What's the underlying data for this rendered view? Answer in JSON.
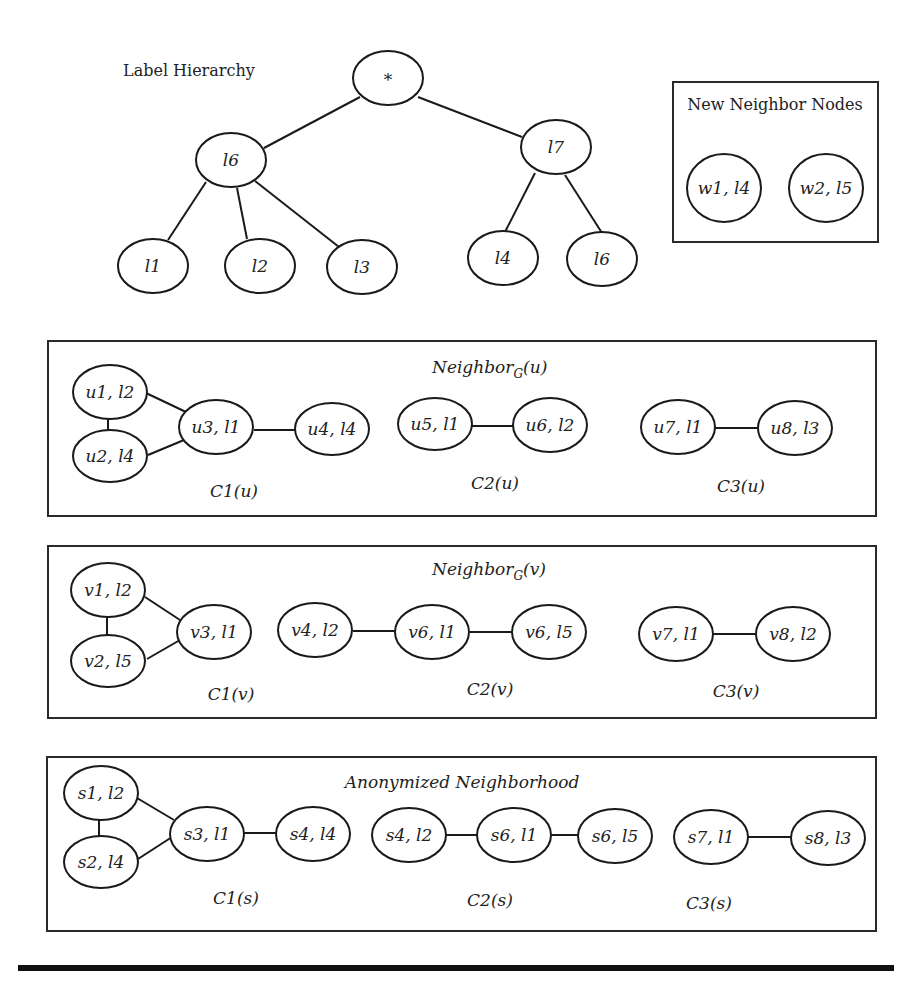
{
  "label_hierarchy": {
    "title": "Label Hierarchy",
    "nodes": [
      {
        "id": "root",
        "label": "*",
        "cx": 388,
        "cy": 78
      },
      {
        "id": "l6",
        "label": "l6",
        "cx": 231,
        "cy": 160
      },
      {
        "id": "l7",
        "label": "l7",
        "cx": 556,
        "cy": 147
      },
      {
        "id": "l1",
        "label": "l1",
        "cx": 153,
        "cy": 266
      },
      {
        "id": "l2",
        "label": "l2",
        "cx": 260,
        "cy": 266
      },
      {
        "id": "l3",
        "label": "l3",
        "cx": 362,
        "cy": 267
      },
      {
        "id": "l4",
        "label": "l4",
        "cx": 503,
        "cy": 258
      },
      {
        "id": "l6b",
        "label": "l6",
        "cx": 602,
        "cy": 259
      }
    ],
    "edges": [
      [
        "root",
        "l6"
      ],
      [
        "root",
        "l7"
      ],
      [
        "l6",
        "l1"
      ],
      [
        "l6",
        "l2"
      ],
      [
        "l6",
        "l3"
      ],
      [
        "l7",
        "l4"
      ],
      [
        "l7",
        "l6b"
      ]
    ]
  },
  "new_neighbor_nodes": {
    "title": "New Neighbor Nodes",
    "nodes": [
      {
        "id": "w1",
        "label": "w1, l4"
      },
      {
        "id": "w2",
        "label": "w2, l5"
      }
    ]
  },
  "neighbor_u": {
    "title_main": "Neighbor",
    "title_sub": "G",
    "title_arg": "(u)",
    "nodes": [
      {
        "id": "u1",
        "label": "u1, l2"
      },
      {
        "id": "u2",
        "label": "u2, l4"
      },
      {
        "id": "u3",
        "label": "u3, l1"
      },
      {
        "id": "u4",
        "label": "u4, l4"
      },
      {
        "id": "u5",
        "label": "u5, l1"
      },
      {
        "id": "u6",
        "label": "u6, l2"
      },
      {
        "id": "u7",
        "label": "u7, l1"
      },
      {
        "id": "u8",
        "label": "u8, l3"
      }
    ],
    "edges": [
      [
        "u1",
        "u2"
      ],
      [
        "u1",
        "u3"
      ],
      [
        "u2",
        "u3"
      ],
      [
        "u3",
        "u4"
      ],
      [
        "u5",
        "u6"
      ],
      [
        "u7",
        "u8"
      ]
    ],
    "components": [
      "C1(u)",
      "C2(u)",
      "C3(u)"
    ]
  },
  "neighbor_v": {
    "title_main": "Neighbor",
    "title_sub": "G",
    "title_arg": "(v)",
    "nodes": [
      {
        "id": "v1",
        "label": "v1, l2"
      },
      {
        "id": "v2",
        "label": "v2, l5"
      },
      {
        "id": "v3",
        "label": "v3, l1"
      },
      {
        "id": "v4",
        "label": "v4, l2"
      },
      {
        "id": "v6a",
        "label": "v6, l1"
      },
      {
        "id": "v6b",
        "label": "v6, l5"
      },
      {
        "id": "v7",
        "label": "v7, l1"
      },
      {
        "id": "v8",
        "label": "v8, l2"
      }
    ],
    "edges": [
      [
        "v1",
        "v2"
      ],
      [
        "v1",
        "v3"
      ],
      [
        "v2",
        "v3"
      ],
      [
        "v4",
        "v6a"
      ],
      [
        "v6a",
        "v6b"
      ],
      [
        "v7",
        "v8"
      ]
    ],
    "components": [
      "C1(v)",
      "C2(v)",
      "C3(v)"
    ]
  },
  "anonymized": {
    "title": "Anonymized Neighborhood",
    "nodes": [
      {
        "id": "s1",
        "label": "s1, l2"
      },
      {
        "id": "s2",
        "label": "s2, l4"
      },
      {
        "id": "s3",
        "label": "s3, l1"
      },
      {
        "id": "s4",
        "label": "s4, l4"
      },
      {
        "id": "s4b",
        "label": "s4, l2"
      },
      {
        "id": "s6",
        "label": "s6, l1"
      },
      {
        "id": "s6b",
        "label": "s6, l5"
      },
      {
        "id": "s7",
        "label": "s7, l1"
      },
      {
        "id": "s8",
        "label": "s8, l3"
      }
    ],
    "edges": [
      [
        "s1",
        "s2"
      ],
      [
        "s1",
        "s3"
      ],
      [
        "s2",
        "s3"
      ],
      [
        "s3",
        "s4"
      ],
      [
        "s4b",
        "s6"
      ],
      [
        "s6",
        "s6b"
      ],
      [
        "s7",
        "s8"
      ]
    ],
    "components": [
      "C1(s)",
      "C2(s)",
      "C3(s)"
    ]
  },
  "colors": {
    "stroke": "#1a1a1a",
    "text": "#222222",
    "background": "#ffffff"
  }
}
